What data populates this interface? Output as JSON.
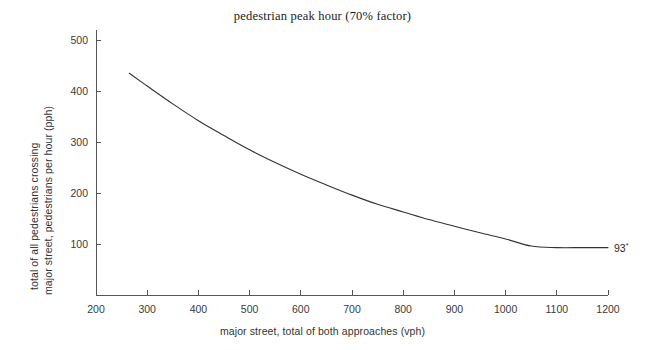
{
  "chart_data": {
    "type": "line",
    "title": "pedestrian peak hour (70% factor)",
    "xlabel": "major street, total of both approaches (vph)",
    "ylabel_line1": "total of all pedestrians crossing",
    "ylabel_line2": "major street, pedestrians per hour (pph)",
    "xlim": [
      200,
      1200
    ],
    "ylim": [
      0,
      520
    ],
    "grid": false,
    "legend": "none",
    "xticks": [
      200,
      300,
      400,
      500,
      600,
      700,
      800,
      900,
      1000,
      1100,
      1200
    ],
    "yticks": [
      100,
      200,
      300,
      400,
      500
    ],
    "xtick_labels": [
      "200",
      "300",
      "400",
      "500",
      "600",
      "700",
      "800",
      "900",
      "1000",
      "1100",
      "1200"
    ],
    "ytick_labels": [
      "100",
      "200",
      "300",
      "400",
      "500"
    ],
    "series": [
      {
        "name": "pedestrian peak hour volume",
        "x": [
          265,
          300,
          350,
          400,
          450,
          500,
          550,
          600,
          650,
          700,
          750,
          800,
          850,
          900,
          950,
          1000,
          1050,
          1100,
          1150,
          1200
        ],
        "values": [
          435,
          410,
          375,
          342,
          313,
          285,
          260,
          237,
          216,
          196,
          178,
          163,
          148,
          135,
          122,
          110,
          96,
          93,
          93,
          93
        ]
      }
    ],
    "annotations": [
      {
        "text": "93",
        "superscript": "*",
        "x": 1200,
        "y": 93
      }
    ],
    "line_color": "#333333",
    "axis_color": "#555555",
    "background_color": "#ffffff"
  },
  "axes_geometry": {
    "plot_left": 96,
    "plot_right": 608,
    "plot_top": 30,
    "plot_bottom": 295
  }
}
